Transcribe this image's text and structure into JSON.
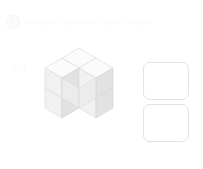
{
  "header": {
    "badge_label": "1",
    "badge_icon": "question-number-badge-icon",
    "title": "Which of these is the same shape?"
  },
  "watermark": {
    "text": "AB"
  },
  "figure": {
    "name": "isometric-cube-figure",
    "cube_count": "6",
    "view": "isometric",
    "colors": {
      "top_face": "#fbfbfb",
      "left_face": "#f1f1f1",
      "right_face": "#e2e2e2",
      "right_face_alt": "#ececec",
      "outline": "#dcdcdc"
    }
  },
  "answers": {
    "label": "answer-options",
    "options": [
      {
        "id": "option-a",
        "label": "",
        "selected": "false"
      },
      {
        "id": "option-b",
        "label": "",
        "selected": "false"
      }
    ]
  }
}
